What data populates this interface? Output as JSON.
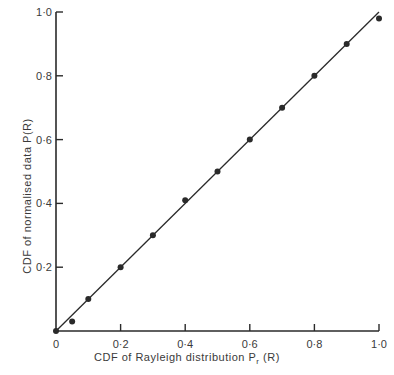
{
  "chart_data": {
    "type": "scatter",
    "title": "",
    "xlabel": "CDF  of  Rayleigh  distribution   P_r(R)",
    "xlabel_parts": {
      "main": "CDF  of  Rayleigh  distribution   P",
      "sub": "r",
      "tail": " (R)"
    },
    "ylabel": "CDF  of  normalised  data   P(R)",
    "xlim": [
      0,
      1.0
    ],
    "ylim": [
      0,
      1.0
    ],
    "grid": false,
    "legend": null,
    "x_ticks": [
      0,
      0.2,
      0.4,
      0.6,
      0.8,
      1.0
    ],
    "x_tick_labels": [
      "0",
      "0·2",
      "0·4",
      "0·6",
      "0·8",
      "1·0"
    ],
    "y_ticks": [
      0.2,
      0.4,
      0.6,
      0.8,
      1.0
    ],
    "y_tick_labels": [
      "0·2",
      "0·4",
      "0·6",
      "0·8",
      "1·0"
    ],
    "series": [
      {
        "name": "normalised data",
        "style": "points",
        "x": [
          0.0,
          0.05,
          0.1,
          0.2,
          0.3,
          0.4,
          0.5,
          0.6,
          0.7,
          0.8,
          0.9,
          1.0
        ],
        "y": [
          0.0,
          0.03,
          0.1,
          0.2,
          0.3,
          0.41,
          0.5,
          0.6,
          0.7,
          0.8,
          0.9,
          0.98
        ]
      },
      {
        "name": "ideal fit",
        "style": "line",
        "x": [
          0.0,
          1.0
        ],
        "y": [
          0.0,
          1.0
        ]
      }
    ],
    "colors": {
      "ink": "#2a2a2a",
      "background": "#ffffff"
    }
  }
}
